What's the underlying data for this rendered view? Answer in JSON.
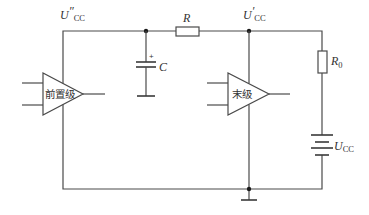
{
  "diagram": {
    "type": "circuit-schematic",
    "labels": {
      "node_preamp_supply": {
        "main": "U",
        "prime": "″",
        "sub": "CC"
      },
      "node_final_supply": {
        "main": "U",
        "prime": "′",
        "sub": "CC"
      },
      "resistor_r": "R",
      "resistor_r0": {
        "main": "R",
        "sub": "0"
      },
      "capacitor": "C",
      "capacitor_polarity": "+",
      "battery": {
        "main": "U",
        "sub": "CC"
      },
      "preamp": "前置级",
      "final_stage": "末级"
    },
    "components": [
      {
        "id": "preamp",
        "kind": "amplifier",
        "label": "前置级"
      },
      {
        "id": "final_stage",
        "kind": "amplifier",
        "label": "末级"
      },
      {
        "id": "R",
        "kind": "resistor",
        "label": "R"
      },
      {
        "id": "R0",
        "kind": "resistor",
        "label": "R0"
      },
      {
        "id": "C",
        "kind": "polarized-capacitor",
        "label": "C"
      },
      {
        "id": "Ucc",
        "kind": "battery",
        "label": "UCC"
      },
      {
        "id": "gnd",
        "kind": "ground"
      }
    ]
  }
}
